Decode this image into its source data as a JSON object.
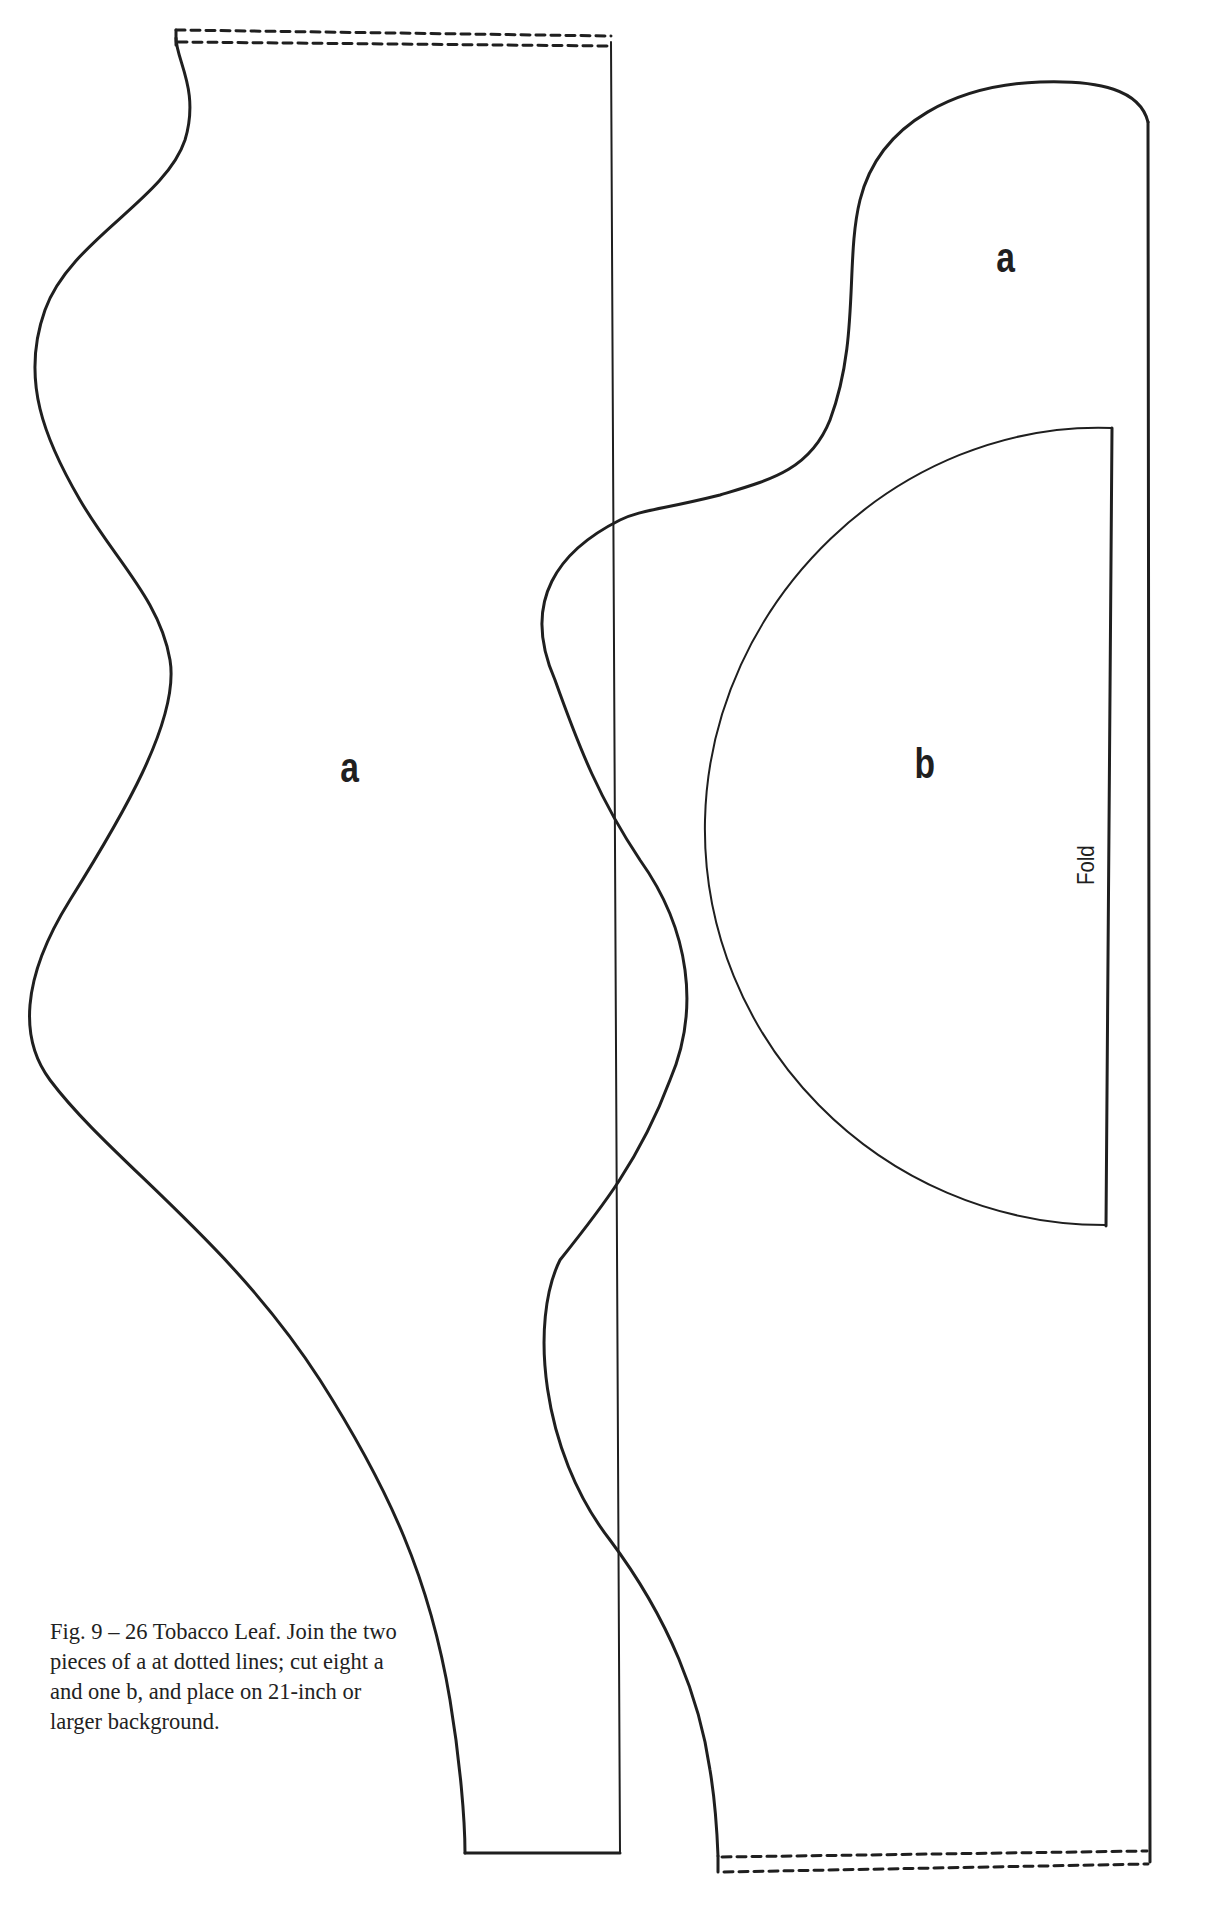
{
  "figure": {
    "piece_labels": {
      "left_a": "a",
      "right_a": "a",
      "b": "b"
    },
    "fold_label": "Fold",
    "caption": "Fig. 9 – 26 Tobacco Leaf. Join the two pieces of a at dotted lines; cut eight a and one b, and place on 21-inch or larger background."
  },
  "colors": {
    "stroke": "#1f1f1f",
    "background": "#ffffff"
  }
}
